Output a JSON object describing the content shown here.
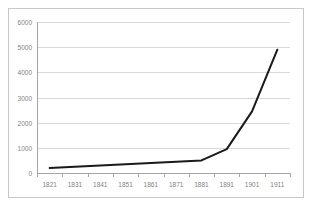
{
  "chart_data": {
    "type": "line",
    "title": "",
    "xlabel": "",
    "ylabel": "",
    "x": [
      1821,
      1831,
      1841,
      1851,
      1861,
      1871,
      1881,
      1891,
      1901,
      1911
    ],
    "categories": [
      "1821",
      "1831",
      "1841",
      "1851",
      "1861",
      "1871",
      "1881",
      "1891",
      "1901",
      "1911"
    ],
    "values": [
      200,
      250,
      300,
      350,
      400,
      450,
      500,
      950,
      2450,
      4900
    ],
    "series": [
      {
        "name": "",
        "values": [
          200,
          250,
          300,
          350,
          400,
          450,
          500,
          950,
          2450,
          4900
        ]
      }
    ],
    "ylim": [
      0,
      6000
    ],
    "y_ticks": [
      0,
      1000,
      2000,
      3000,
      4000,
      5000,
      6000
    ],
    "y_tick_labels": [
      "0",
      "1000",
      "2000",
      "3000",
      "4000",
      "5000",
      "6000"
    ],
    "x_tick_labels": [
      "1821",
      "1831",
      "1841",
      "1851",
      "1861",
      "1871",
      "1881",
      "1891",
      "1901",
      "1911"
    ],
    "grid": "horizontal",
    "legend": "none",
    "colors": {
      "line": "#1a1a1a",
      "gridline": "#d9d9d9",
      "axis": "#a6a6a6",
      "tick_label": "#7f7f7f",
      "plot_background": "#ffffff",
      "frame_border": "#c8c8c8"
    }
  }
}
